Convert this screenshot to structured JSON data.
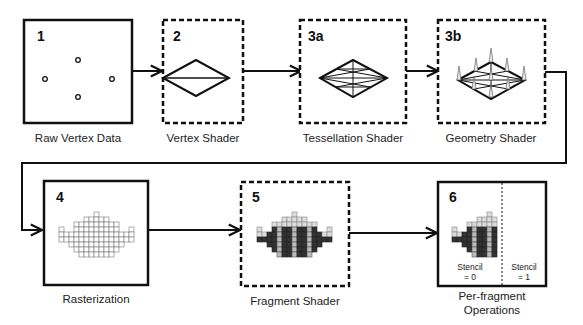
{
  "diagram": {
    "stages": [
      {
        "id": "1",
        "label": "Raw Vertex Data",
        "border": "solid"
      },
      {
        "id": "2",
        "label": "Vertex Shader",
        "border": "dashed"
      },
      {
        "id": "3a",
        "label": "Tessellation Shader",
        "border": "dashed"
      },
      {
        "id": "3b",
        "label": "Geometry Shader",
        "border": "dashed"
      },
      {
        "id": "4",
        "label": "Rasterization",
        "border": "solid"
      },
      {
        "id": "5",
        "label": "Fragment Shader",
        "border": "dashed"
      },
      {
        "id": "6",
        "label_line1": "Per-fragment",
        "label_line2": "Operations",
        "border": "solid",
        "stencil_left_line1": "Stencil",
        "stencil_left_line2": "= 0",
        "stencil_right_line1": "Stencil",
        "stencil_right_line2": "= 1"
      }
    ],
    "colors": {
      "stroke": "#111111",
      "pixel_light": "#ffffff",
      "pixel_light_stroke": "#888888",
      "pixel_dark": "#333333",
      "pixel_mid": "#bbbbbb"
    }
  }
}
